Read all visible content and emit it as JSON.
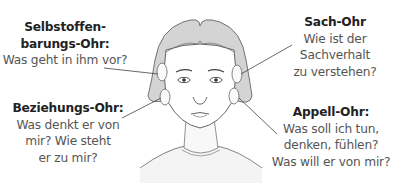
{
  "diagram": {
    "type": "four-ears-model",
    "labels": [
      {
        "id": "selbstoffenbarung",
        "title_lines": [
          "Selbstoffen-",
          "barungs-Ohr:"
        ],
        "question_lines": [
          "Was geht in ihm vor?"
        ],
        "position": "top-left"
      },
      {
        "id": "sach",
        "title_lines": [
          "Sach-Ohr"
        ],
        "question_lines": [
          "Wie ist der",
          "Sachverhalt",
          "zu verstehen?"
        ],
        "position": "top-right"
      },
      {
        "id": "beziehung",
        "title_lines": [
          "Beziehungs-Ohr:"
        ],
        "question_lines": [
          "Was denkt er von",
          "mir? Wie steht",
          "er zu mir?"
        ],
        "position": "bottom-left"
      },
      {
        "id": "appell",
        "title_lines": [
          "Appell-Ohr:"
        ],
        "question_lines": [
          "Was soll ich tun,",
          "denken, fühlen?",
          "Was will er von mir?"
        ],
        "position": "bottom-right"
      }
    ],
    "illustration": "face-with-four-ears",
    "colors": {
      "title_text": "#222222",
      "question_text": "#555555",
      "hair": "#c8c8c8",
      "line": "#444444"
    }
  }
}
